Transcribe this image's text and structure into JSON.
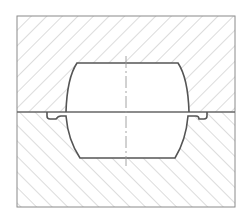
{
  "diagram": {
    "type": "die-forging-cross-section",
    "width": 248,
    "height": 221,
    "colors": {
      "background": "#ffffff",
      "outline": "#7a7a7a",
      "cavity_outline": "#555555",
      "hatch": "#c4c4c4",
      "centerline": "#9a9a9a"
    },
    "parts": [
      {
        "id": "upper-die",
        "label": "",
        "hatch_direction": "forward-slash"
      },
      {
        "id": "lower-die",
        "label": "",
        "hatch_direction": "back-slash"
      },
      {
        "id": "workpiece-cavity",
        "label": ""
      },
      {
        "id": "flash-gutter-left",
        "label": ""
      },
      {
        "id": "flash-gutter-right",
        "label": ""
      },
      {
        "id": "parting-line",
        "label": ""
      },
      {
        "id": "centerline",
        "label": ""
      }
    ],
    "text_labels": []
  }
}
